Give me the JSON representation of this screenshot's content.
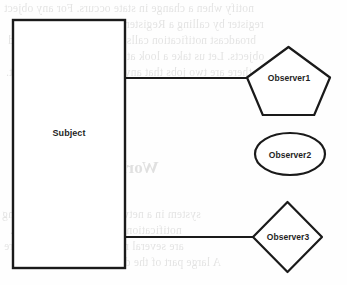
{
  "diagram": {
    "type": "uml-sketch",
    "stroke_color": "#1a1a1a",
    "fill_color": "#ffffff",
    "background_color": "#fefefe",
    "nodes": [
      {
        "id": "subject",
        "label": "Subject",
        "shape": "rectangle",
        "x": 13,
        "y": 20,
        "width": 112,
        "height": 248
      },
      {
        "id": "observer1",
        "label": "Observer1",
        "shape": "pentagon",
        "x": 247,
        "y": 47,
        "width": 83,
        "height": 68
      },
      {
        "id": "observer2",
        "label": "Observer2",
        "shape": "ellipse",
        "x": 255,
        "y": 133,
        "width": 70,
        "height": 42
      },
      {
        "id": "observer3",
        "label": "Observer3",
        "shape": "diamond",
        "x": 253,
        "y": 202,
        "width": 69,
        "height": 70
      }
    ],
    "connectors": [
      {
        "id": "subject-to-observer1",
        "from": "subject",
        "to": "observer1",
        "x1": 125,
        "y1": 78,
        "x2": 252,
        "y2": 78
      },
      {
        "id": "subject-to-observer3",
        "from": "subject",
        "to": "observer3",
        "x1": 125,
        "y1": 237,
        "x2": 256,
        "y2": 237
      }
    ]
  },
  "bleed_through": {
    "note": "faint mirrored text showing through from the reverse side of the scanned page",
    "heading": "World Example",
    "lines": [
      "notify when a change in state occurs. For any object",
      "register by calling a Register method on the subject.",
      "broadcast notification calls to each of the registered",
      "objects. Let us take a look at a real world example.",
      "there are two jobs that any person has to do with it.",
      "system in a network, a simple monitoring",
      "notification when the state changes.",
      "are several methods in the UI that are",
      "A large part of the design is the notification"
    ]
  }
}
